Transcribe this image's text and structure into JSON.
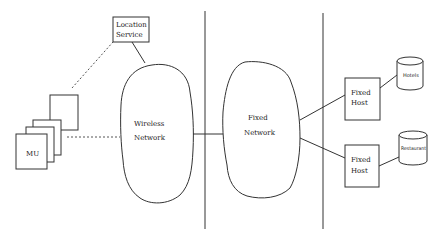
{
  "diagram": {
    "type": "network-architecture",
    "nodes": {
      "location_service": {
        "line1": "Location",
        "line2": "Service"
      },
      "mu": {
        "label": "MU"
      },
      "wireless_network": {
        "line1": "Wireless",
        "line2": "Network"
      },
      "fixed_network": {
        "line1": "Fixed",
        "line2": "Network"
      },
      "fixed_host_1": {
        "line1": "Fixed",
        "line2": "Host"
      },
      "fixed_host_2": {
        "line1": "Fixed",
        "line2": "Host"
      },
      "db_hotels": {
        "label": "Hotels"
      },
      "db_restaurant": {
        "label": "Restaurant"
      }
    },
    "edges": [
      {
        "from": "location_service",
        "to": "wireless_network",
        "style": "solid"
      },
      {
        "from": "mu",
        "to": "location_service",
        "style": "dashed"
      },
      {
        "from": "mu",
        "to": "wireless_network",
        "style": "dashed"
      },
      {
        "from": "wireless_network",
        "to": "fixed_network",
        "style": "solid"
      },
      {
        "from": "fixed_network",
        "to": "fixed_host_1",
        "style": "solid"
      },
      {
        "from": "fixed_network",
        "to": "fixed_host_2",
        "style": "solid"
      },
      {
        "from": "fixed_host_1",
        "to": "db_hotels",
        "style": "solid"
      },
      {
        "from": "fixed_host_2",
        "to": "db_restaurant",
        "style": "solid"
      }
    ],
    "dividers": 2
  }
}
